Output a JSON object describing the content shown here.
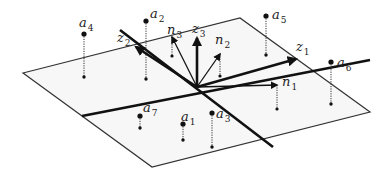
{
  "diagram": {
    "plane": {
      "corners": [
        [
          23,
          73
        ],
        [
          240,
          18
        ],
        [
          370,
          112
        ],
        [
          152,
          167
        ]
      ],
      "fill": "#f7f7f7",
      "stroke": "#333333"
    },
    "origin": [
      197,
      87
    ],
    "axes_lines": [
      {
        "name": "thick-line-a",
        "from": [
          82,
          116
        ],
        "to": [
          370,
          60
        ]
      },
      {
        "name": "thick-line-b",
        "from": [
          120,
          30
        ],
        "to": [
          273,
          147
        ]
      }
    ],
    "vectors": [
      {
        "id": "z1",
        "label": "z",
        "subscript": "1",
        "tip": [
          296,
          59
        ],
        "label_pos": [
          296,
          51
        ],
        "thick": true
      },
      {
        "id": "z2",
        "label": "z",
        "subscript": "2",
        "tip": [
          136,
          47
        ],
        "label_pos": [
          117,
          42
        ],
        "thick": true
      },
      {
        "id": "z3",
        "label": "z",
        "subscript": "3",
        "tip": [
          197,
          38
        ],
        "label_pos": [
          192,
          33
        ],
        "thick": true
      },
      {
        "id": "n1",
        "label": "n",
        "subscript": "1",
        "tip": [
          277,
          85
        ],
        "label_pos": [
          282,
          86
        ],
        "thick": false
      },
      {
        "id": "n2",
        "label": "n",
        "subscript": "2",
        "tip": [
          220,
          54
        ],
        "label_pos": [
          215,
          44
        ],
        "thick": false
      },
      {
        "id": "n3",
        "label": "n",
        "subscript": "3",
        "tip": [
          172,
          37
        ],
        "label_pos": [
          167,
          34
        ],
        "thick": false
      }
    ],
    "points": [
      {
        "id": "a1",
        "label": "a",
        "subscript": "1",
        "top": [
          183,
          124
        ],
        "foot": [
          183,
          140
        ],
        "label_pos": [
          181,
          121
        ]
      },
      {
        "id": "a2",
        "label": "a",
        "subscript": "2",
        "top": [
          146,
          21
        ],
        "foot": [
          146,
          79
        ],
        "label_pos": [
          150,
          18
        ]
      },
      {
        "id": "a3",
        "label": "a",
        "subscript": "3",
        "top": [
          212,
          113
        ],
        "foot": [
          212,
          147
        ],
        "label_pos": [
          216,
          118
        ]
      },
      {
        "id": "a4",
        "label": "a",
        "subscript": "4",
        "top": [
          84,
          34
        ],
        "foot": [
          84,
          77
        ],
        "label_pos": [
          79,
          27
        ]
      },
      {
        "id": "a5",
        "label": "a",
        "subscript": "5",
        "top": [
          266,
          16
        ],
        "foot": [
          266,
          55
        ],
        "label_pos": [
          272,
          19
        ]
      },
      {
        "id": "a6",
        "label": "a",
        "subscript": "6",
        "top": [
          331,
          62
        ],
        "foot": [
          331,
          104
        ],
        "label_pos": [
          337,
          67
        ]
      },
      {
        "id": "a7",
        "label": "a",
        "subscript": "7",
        "top": [
          140,
          116
        ],
        "foot": [
          140,
          128
        ],
        "label_pos": [
          143,
          112
        ]
      }
    ],
    "normal_feet": [
      {
        "id": "n2-foot",
        "top": [
          220,
          54
        ],
        "foot": [
          220,
          76
        ]
      },
      {
        "id": "n3-foot",
        "top": [
          172,
          37
        ],
        "foot": [
          172,
          56
        ]
      },
      {
        "id": "n1-foot",
        "top": [
          277,
          85
        ],
        "foot": [
          277,
          109
        ]
      }
    ]
  }
}
